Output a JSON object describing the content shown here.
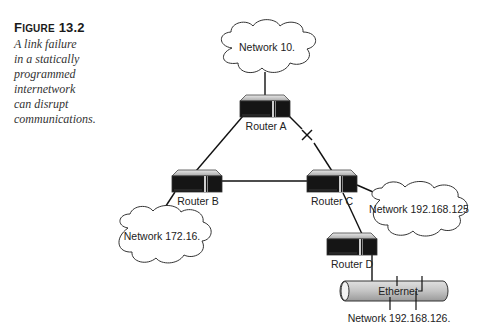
{
  "figure": {
    "number_prefix": "F",
    "number_rest": "IGURE",
    "number": "13.2",
    "caption_lines": [
      "A link failure",
      "in a statically",
      "programmed",
      "internetwork",
      "can disrupt",
      "communications."
    ]
  },
  "diagram": {
    "clouds": [
      {
        "id": "net10",
        "label": "Network 10."
      },
      {
        "id": "net172",
        "label": "Network 172.16."
      },
      {
        "id": "net192_125",
        "label": "Network 192.168.125"
      }
    ],
    "routers": [
      {
        "id": "A",
        "label": "Router A"
      },
      {
        "id": "B",
        "label": "Router B"
      },
      {
        "id": "C",
        "label": "Router C"
      },
      {
        "id": "D",
        "label": "Router D"
      }
    ],
    "ethernet": {
      "label": "Ethernet",
      "network_label": "Network 192.168.126."
    },
    "link_failure_marker": "×",
    "links": [
      {
        "from": "Network 10.",
        "to": "Router A",
        "status": "up"
      },
      {
        "from": "Router A",
        "to": "Router B",
        "status": "up"
      },
      {
        "from": "Router A",
        "to": "Router C",
        "status": "failed"
      },
      {
        "from": "Router B",
        "to": "Router C",
        "status": "up"
      },
      {
        "from": "Router B",
        "to": "Network 172.16.",
        "status": "up"
      },
      {
        "from": "Router C",
        "to": "Network 192.168.125",
        "status": "up"
      },
      {
        "from": "Router C",
        "to": "Router D",
        "status": "up"
      },
      {
        "from": "Router D",
        "to": "Ethernet",
        "status": "up"
      }
    ]
  }
}
